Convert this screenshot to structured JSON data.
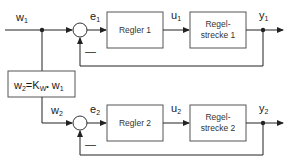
{
  "diagram": {
    "type": "block-diagram",
    "colors": {
      "line": "#222222",
      "box_border": "#555555",
      "background": "#ffffff"
    },
    "loop1": {
      "input_label": "w",
      "input_sub": "1",
      "error_label": "e",
      "error_sub": "1",
      "controller_label": "Regler 1",
      "control_signal_label": "u",
      "control_signal_sub": "1",
      "plant_line1": "Regel-",
      "plant_line2": "strecke 1",
      "output_label": "y",
      "output_sub": "1",
      "feedback_sign": "—"
    },
    "gain": {
      "lhs": "w",
      "lhs_sub": "2",
      "eq": "=K",
      "k_sub": "W",
      "dot": "•",
      "rhs": " w",
      "rhs_sub": "1"
    },
    "loop2": {
      "input_label": "w",
      "input_sub": "2",
      "error_label": "e",
      "error_sub": "2",
      "controller_label": "Regler 2",
      "control_signal_label": "u",
      "control_signal_sub": "2",
      "plant_line1": "Regel-",
      "plant_line2": "strecke 2",
      "output_label": "y",
      "output_sub": "2",
      "feedback_sign": "—"
    }
  }
}
